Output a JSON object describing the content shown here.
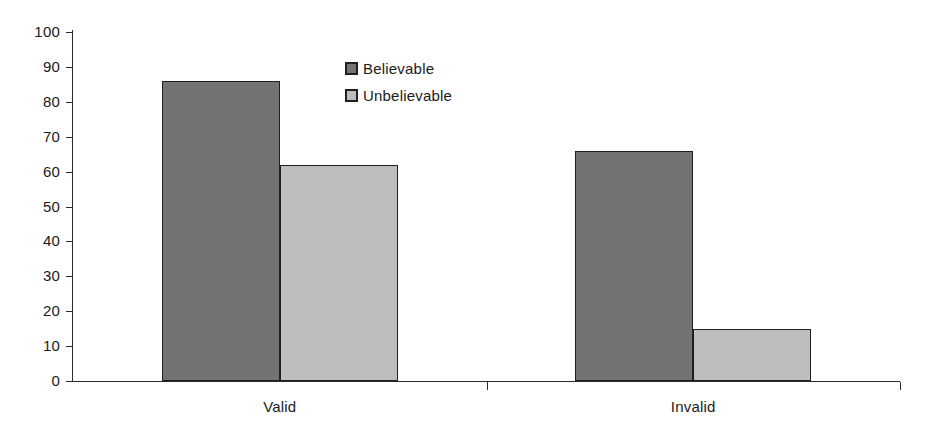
{
  "chart_data": {
    "type": "bar",
    "title": "",
    "subtitle": "",
    "xlabel": "",
    "ylabel": "",
    "categories": [
      "Valid",
      "Invalid"
    ],
    "series": [
      {
        "name": "Believable",
        "color": "#737373",
        "values": [
          86,
          66
        ]
      },
      {
        "name": "Unbelievable",
        "color": "#bdbdbd",
        "values": [
          62,
          15
        ]
      }
    ],
    "ylim": [
      0,
      100
    ],
    "ytick_step": 10,
    "yticks": [
      0,
      10,
      20,
      30,
      40,
      50,
      60,
      70,
      80,
      90,
      100
    ],
    "ytick_labels": [
      "0",
      "10",
      "20",
      "30",
      "40",
      "50",
      "60",
      "70",
      "80",
      "90",
      "100"
    ],
    "grid": false,
    "legend_position": "top-center",
    "legend": [
      "Believable",
      "Unbelievable"
    ],
    "annotations": []
  },
  "axis": {
    "y_labels": [
      "100",
      "90",
      "80",
      "70",
      "60",
      "50",
      "40",
      "30",
      "20",
      "10",
      "0"
    ],
    "x_labels": [
      "Valid",
      "Invalid"
    ]
  },
  "legend": {
    "items": [
      {
        "label": "Believable"
      },
      {
        "label": "Unbelievable"
      }
    ]
  },
  "colors": {
    "believable": "#737373",
    "unbelievable": "#bdbdbd",
    "axis": "#2b2b2b",
    "text": "#1a1a1a",
    "background": "#ffffff"
  }
}
